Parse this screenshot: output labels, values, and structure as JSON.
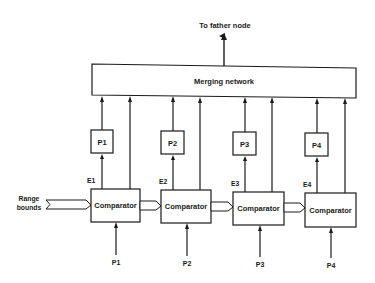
{
  "diagram": {
    "top_label": "To father node",
    "merging_network": {
      "label": "Merging network"
    },
    "range_bounds": {
      "line1": "Range",
      "line2": "bounds"
    },
    "units": [
      {
        "processor_label": "P1",
        "enable_label": "E1",
        "comparator_label": "Comparator",
        "input_label": "P1"
      },
      {
        "processor_label": "P2",
        "enable_label": "E2",
        "comparator_label": "Comparator",
        "input_label": "P2"
      },
      {
        "processor_label": "P3",
        "enable_label": "E3",
        "comparator_label": "Comparator",
        "input_label": "P3"
      },
      {
        "processor_label": "P4",
        "enable_label": "E4",
        "comparator_label": "Comparator",
        "input_label": "P4"
      }
    ],
    "colors": {
      "line": "#1a1a1a",
      "background": "#ffffff"
    }
  }
}
